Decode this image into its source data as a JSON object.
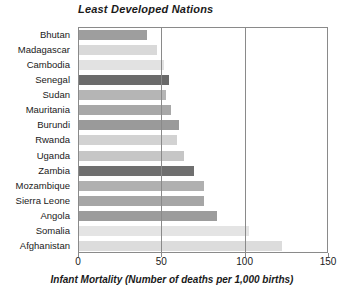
{
  "chart_data": {
    "type": "bar",
    "orientation": "horizontal",
    "title": "Least Developed Nations",
    "xlabel": "Infant Mortality (Number of deaths per 1,000 births)",
    "ylabel": "",
    "xlim": [
      0,
      150
    ],
    "xticks": [
      0,
      50,
      100,
      150
    ],
    "xtick_labels": [
      "0",
      "50",
      "100",
      "150"
    ],
    "grid": true,
    "gridlines_at": [
      50,
      100
    ],
    "legend": null,
    "categories": [
      "Bhutan",
      "Madagascar",
      "Cambodia",
      "Senegal",
      "Sudan",
      "Mauritania",
      "Burundi",
      "Rwanda",
      "Uganda",
      "Zambia",
      "Mozambique",
      "Sierra Leone",
      "Angola",
      "Somalia",
      "Afghanistan"
    ],
    "values": [
      41,
      47,
      51,
      54,
      52,
      55,
      60,
      59,
      63,
      69,
      75,
      75,
      83,
      102,
      122
    ],
    "bar_colors": [
      "#9e9e9e",
      "#d9d9d9",
      "#e2e2e2",
      "#6b6b6b",
      "#b5b5b5",
      "#a8a8a8",
      "#9a9a9a",
      "#d2d2d2",
      "#c6c6c6",
      "#6f6f6f",
      "#b0b0b0",
      "#a6a6a6",
      "#9c9c9c",
      "#e4e4e4",
      "#dcdcdc"
    ],
    "axis_color": "#8a8a8a",
    "background": "#ffffff"
  }
}
